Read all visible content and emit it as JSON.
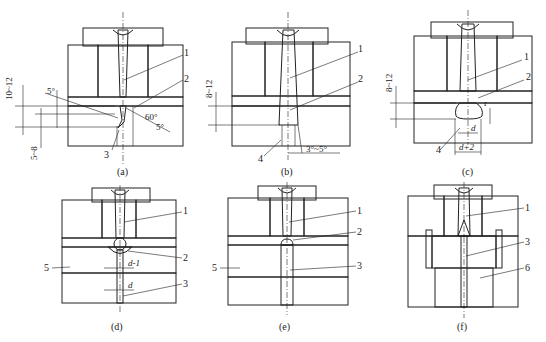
{
  "figure": {
    "panels": [
      {
        "id": "a",
        "caption": "(a)",
        "callouts": [
          "1",
          "2",
          "3"
        ],
        "dimensions": [
          "10~12",
          "5~8"
        ],
        "angles": [
          "5°",
          "60°",
          "5°"
        ]
      },
      {
        "id": "b",
        "caption": "(b)",
        "callouts": [
          "1",
          "2",
          "4"
        ],
        "dimensions": [
          "8~12"
        ],
        "angles": [
          "3°~5°"
        ]
      },
      {
        "id": "c",
        "caption": "(c)",
        "callouts": [
          "1",
          "2",
          "4"
        ],
        "dimensions": [
          "8~12",
          "d",
          "d+2",
          "r"
        ]
      },
      {
        "id": "d",
        "caption": "(d)",
        "callouts": [
          "1",
          "2",
          "3",
          "5"
        ],
        "dimensions": [
          "d-1",
          "d"
        ]
      },
      {
        "id": "e",
        "caption": "(e)",
        "callouts": [
          "1",
          "2",
          "3",
          "5"
        ]
      },
      {
        "id": "f",
        "caption": "(f)",
        "callouts": [
          "1",
          "3",
          "6"
        ]
      }
    ]
  },
  "labels": {
    "a": {
      "caption": "(a)",
      "c1": "1",
      "c2": "2",
      "c3": "3",
      "dim1": "10~12",
      "dim2": "5~8",
      "ang1": "5°",
      "ang2": "60°",
      "ang3": "5°"
    },
    "b": {
      "caption": "(b)",
      "c1": "1",
      "c2": "2",
      "c4": "4",
      "dim1": "8~12",
      "ang1": "3°~5°"
    },
    "c": {
      "caption": "(c)",
      "c1": "1",
      "c2": "2",
      "c4": "4",
      "dim1": "8~12",
      "d": "d",
      "d2": "d+2",
      "r": "r"
    },
    "d": {
      "caption": "(d)",
      "c1": "1",
      "c2": "2",
      "c3": "3",
      "c5": "5",
      "dm1": "d-1",
      "d": "d"
    },
    "e": {
      "caption": "(e)",
      "c1": "1",
      "c2": "2",
      "c3": "3",
      "c5": "5"
    },
    "f": {
      "caption": "(f)",
      "c1": "1",
      "c3": "3",
      "c6": "6"
    }
  },
  "colors": {
    "line": "#222222",
    "background": "#ffffff"
  }
}
